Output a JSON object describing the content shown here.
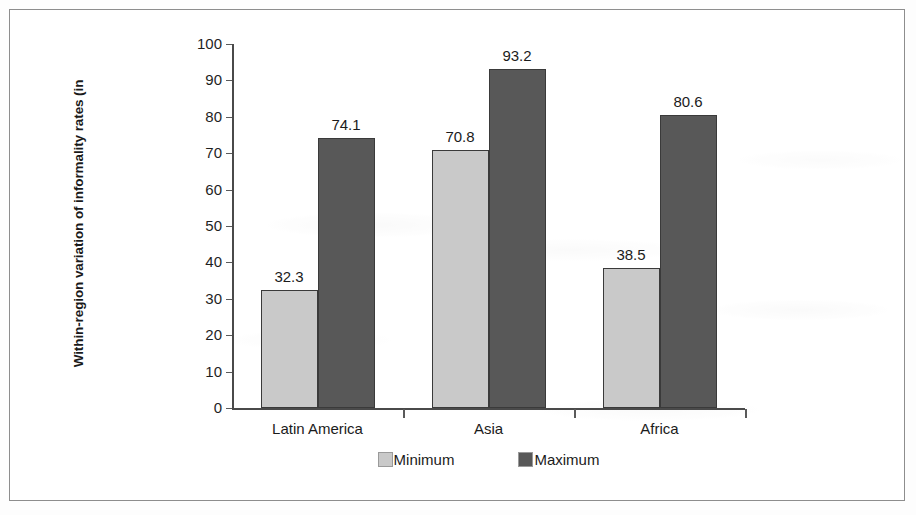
{
  "chart_data": {
    "type": "bar",
    "title": "",
    "xlabel": "",
    "ylabel": "Within-region variation of informality rates  (in",
    "ylim": [
      0,
      100
    ],
    "ytick_step": 10,
    "yticks": [
      "100",
      "90",
      "80",
      "70",
      "60",
      "50",
      "40",
      "30",
      "20",
      "10",
      "0"
    ],
    "grid": false,
    "legend_position": "bottom-center",
    "categories": [
      "Latin America",
      "Asia",
      "Africa"
    ],
    "series": [
      {
        "name": "Minimum",
        "color": "#c9c9c9",
        "values": [
          32.3,
          70.8,
          38.5
        ],
        "labels": [
          "32.3",
          "70.8",
          "38.5"
        ]
      },
      {
        "name": "Maximum",
        "color": "#585858",
        "values": [
          74.1,
          93.2,
          80.6
        ],
        "labels": [
          "74.1",
          "93.2",
          "80.6"
        ]
      }
    ]
  },
  "legend": {
    "items": [
      {
        "label": "Minimum",
        "swatch": "min"
      },
      {
        "label": "Maximum",
        "swatch": "max"
      }
    ]
  },
  "colors": {
    "minimum": "#c9c9c9",
    "maximum": "#585858",
    "axis": "#4a4a4a",
    "frame": "#8d8d8d"
  }
}
